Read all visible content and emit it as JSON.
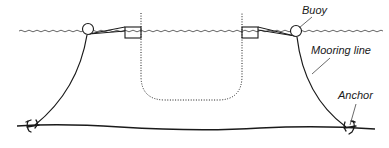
{
  "diagram": {
    "type": "mooring-system-schematic",
    "labels": {
      "buoy": "Buoy",
      "mooring_line": "Mooring line",
      "anchor": "Anchor"
    },
    "components": [
      {
        "name": "water-surface",
        "style": "wavy"
      },
      {
        "name": "buoy",
        "count": 2,
        "shape": "circle"
      },
      {
        "name": "float-box",
        "count": 2,
        "shape": "rectangle"
      },
      {
        "name": "net-enclosure",
        "style": "dotted"
      },
      {
        "name": "mooring-line",
        "count": 2,
        "style": "solid curve"
      },
      {
        "name": "anchor",
        "count": 2
      },
      {
        "name": "seabed",
        "style": "solid line"
      }
    ],
    "colors": {
      "stroke": "#1a1a1a",
      "water": "#555555",
      "background": "#ffffff"
    }
  }
}
